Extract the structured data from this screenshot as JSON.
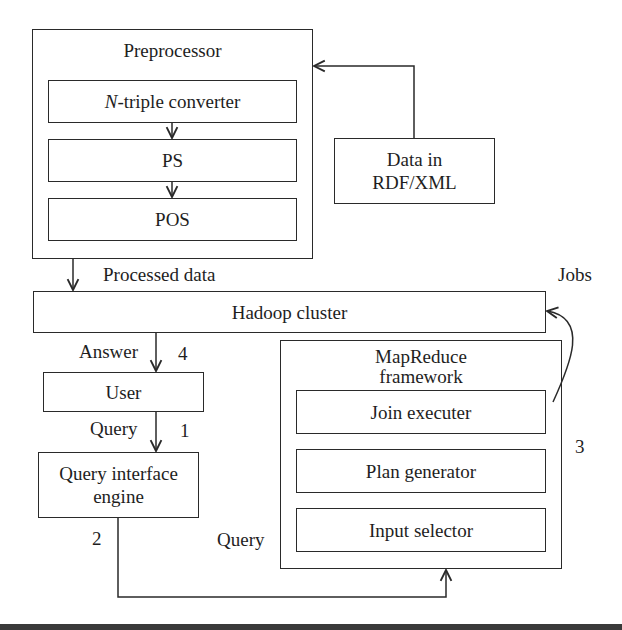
{
  "diagram": {
    "preprocessor": {
      "title": "Preprocessor",
      "steps": [
        {
          "prefix": "N",
          "label": "-triple converter"
        },
        {
          "prefix": "",
          "label": "PS"
        },
        {
          "prefix": "",
          "label": "POS"
        }
      ]
    },
    "data_source": {
      "line1": "Data in",
      "line2": "RDF/XML"
    },
    "hadoop": {
      "label": "Hadoop cluster"
    },
    "mapreduce": {
      "title_line1": "MapReduce",
      "title_line2": "framework",
      "components": [
        {
          "label": "Join executer"
        },
        {
          "label": "Plan generator"
        },
        {
          "label": "Input selector"
        }
      ]
    },
    "user": {
      "label": "User"
    },
    "query_engine": {
      "line1": "Query interface",
      "line2": "engine"
    },
    "edge_labels": {
      "processed_data": "Processed data",
      "jobs": "Jobs",
      "answer": "Answer",
      "step4": "4",
      "query_user": "Query",
      "step1": "1",
      "step2": "2",
      "step3": "3",
      "query_mapreduce": "Query"
    },
    "colors": {
      "stroke": "#2a2a2a",
      "text": "#1e1e1e",
      "background": "#ffffff",
      "bottom_bar": "#3a3a3a"
    }
  }
}
